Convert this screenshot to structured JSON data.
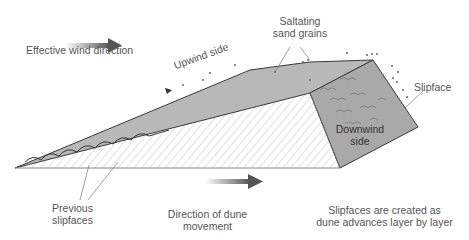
{
  "labels": {
    "wind": "Effective wind direction",
    "saltating_1": "Saltating",
    "saltating_2": "sand grains",
    "upwind": "Upwind side",
    "slipface": "Slipface",
    "downwind_1": "Downwind",
    "downwind_2": "side",
    "previous_1": "Previous",
    "previous_2": "slipfaces",
    "movement_1": "Direction of dune",
    "movement_2": "movement",
    "note_1": "Slipfaces are created as",
    "note_2": "dune advances layer by layer"
  },
  "colors": {
    "dune_fill": "#b4b4b4",
    "slipface_fill": "#a8a8a8",
    "hatch": "#bdbdbd",
    "outline": "#3a3a3a",
    "arrow": "#555555"
  }
}
